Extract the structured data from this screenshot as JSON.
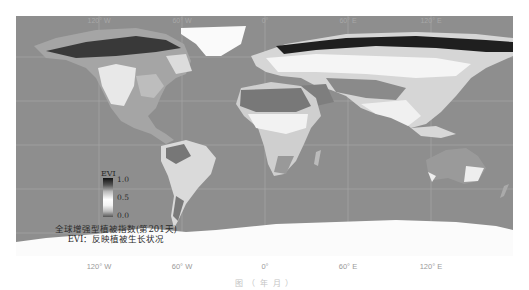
{
  "figure": {
    "type": "global-raster-map",
    "projection": "equirectangular",
    "variable": "EVI",
    "palette": "greyscale (low=grey, mid=white, high=black)",
    "ocean_color": "#8e8e8e",
    "gridline_color": "#a9a9a9"
  },
  "axes": {
    "top_labels": [
      "120° W",
      "60° W",
      "0°",
      "60° E",
      "120° E"
    ],
    "bottom_labels": [
      "120° W",
      "60° W",
      "0°",
      "60° E",
      "120° E"
    ]
  },
  "legend": {
    "title": "EVI",
    "ticks": [
      "1.0",
      "0.5",
      "0.0"
    ]
  },
  "annotation": {
    "line1": "全球增强型植被指数(第201天)",
    "line2": "EVI：反映植被生长状况"
  },
  "caption": {
    "text": "图          （         年   月        ）"
  }
}
